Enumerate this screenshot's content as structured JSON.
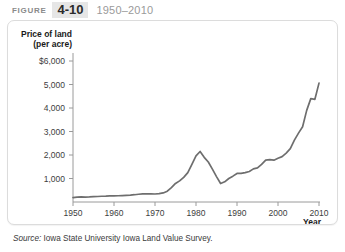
{
  "header": {
    "figure_word": "FIGURE",
    "figure_number": "4-10",
    "year_range": "1950–2010"
  },
  "source": {
    "label": "Source:",
    "text": " Iowa State University Iowa Land Value Survey."
  },
  "chart_data": {
    "type": "line",
    "title": "",
    "xlabel": "Year",
    "ylabel": "Price of land (per acre)",
    "ylabel_line1": "Price of land",
    "ylabel_line2": "(per acre)",
    "xlim": [
      1950,
      2010
    ],
    "ylim": [
      0,
      6000
    ],
    "grid": false,
    "legend": "none",
    "line_color": "#6e6e6e",
    "xticks": [
      1950,
      1960,
      1970,
      1980,
      1990,
      2000,
      2010
    ],
    "xtick_labels": [
      "1950",
      "1960",
      "1970",
      "1980",
      "1990",
      "2000",
      "2010"
    ],
    "yticks": [
      1000,
      2000,
      3000,
      4000,
      5000,
      6000
    ],
    "ytick_labels": [
      "1,000",
      "2,000",
      "3,000",
      "4,000",
      "5,000",
      "$6,000"
    ],
    "series": [
      {
        "name": "Iowa farmland price per acre",
        "x": [
          1950,
          1951,
          1952,
          1953,
          1954,
          1955,
          1956,
          1957,
          1958,
          1959,
          1960,
          1961,
          1962,
          1963,
          1964,
          1965,
          1966,
          1967,
          1968,
          1969,
          1970,
          1971,
          1972,
          1973,
          1974,
          1975,
          1976,
          1977,
          1978,
          1979,
          1980,
          1981,
          1982,
          1983,
          1984,
          1985,
          1986,
          1987,
          1988,
          1989,
          1990,
          1991,
          1992,
          1993,
          1994,
          1995,
          1996,
          1997,
          1998,
          1999,
          2000,
          2001,
          2002,
          2003,
          2004,
          2005,
          2006,
          2007,
          2008,
          2009,
          2010
        ],
        "values": [
          190,
          205,
          215,
          210,
          215,
          225,
          235,
          245,
          250,
          260,
          262,
          265,
          275,
          285,
          295,
          310,
          330,
          345,
          350,
          345,
          340,
          355,
          385,
          460,
          615,
          790,
          900,
          1050,
          1250,
          1600,
          1960,
          2150,
          1900,
          1700,
          1400,
          1080,
          787,
          860,
          1000,
          1100,
          1215,
          1220,
          1250,
          1300,
          1410,
          1450,
          1600,
          1780,
          1800,
          1780,
          1860,
          1930,
          2080,
          2270,
          2630,
          2930,
          3200,
          3900,
          4400,
          4370,
          5060
        ]
      }
    ],
    "annotations": {
      "peak_year": 1981,
      "peak_value": 2150,
      "trough_year": 1986,
      "trough_value": 787,
      "end_year": 2010,
      "end_value": 5060
    }
  }
}
